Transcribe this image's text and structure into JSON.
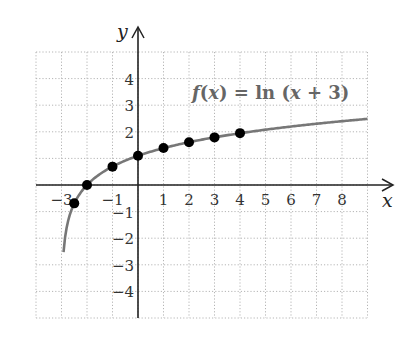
{
  "chart_data": {
    "type": "line",
    "title": "",
    "function_label": "f(x) = ln (x + 3)",
    "function_label_parts": {
      "f": "f",
      "open": "(",
      "x": "x",
      "close": ")",
      "eq": " = ",
      "ln": "ln",
      "arg": " (",
      "x2": "x",
      "rest": " + 3)"
    },
    "xlabel": "x",
    "ylabel": "y",
    "xlim": [
      -4,
      9
    ],
    "ylim": [
      -5,
      5
    ],
    "grid": true,
    "grid_style": "dotted",
    "x_ticks": [
      -3,
      -1,
      1,
      2,
      3,
      4,
      5,
      6,
      7,
      8
    ],
    "x_tick_labels": [
      "−3",
      "−1",
      "1",
      "2",
      "3",
      "4",
      "5",
      "6",
      "7",
      "8"
    ],
    "y_ticks": [
      4,
      3,
      2,
      -1,
      -2,
      -3,
      -4
    ],
    "y_tick_labels": [
      "4",
      "3",
      "2",
      "−1",
      "−2",
      "−3",
      "−4"
    ],
    "curve": {
      "expression": "ln(x+3)",
      "x_start": -2.92,
      "x_end": 9,
      "color": "#777777"
    },
    "points": [
      {
        "x": -2.5,
        "y": -0.69
      },
      {
        "x": -2,
        "y": 0
      },
      {
        "x": -1,
        "y": 0.69
      },
      {
        "x": 0,
        "y": 1.1
      },
      {
        "x": 1,
        "y": 1.39
      },
      {
        "x": 2,
        "y": 1.61
      },
      {
        "x": 3,
        "y": 1.79
      },
      {
        "x": 4,
        "y": 1.95
      }
    ],
    "point_color": "#000000",
    "axis_color": "#222222",
    "grid_color": "#b5b5b5"
  }
}
